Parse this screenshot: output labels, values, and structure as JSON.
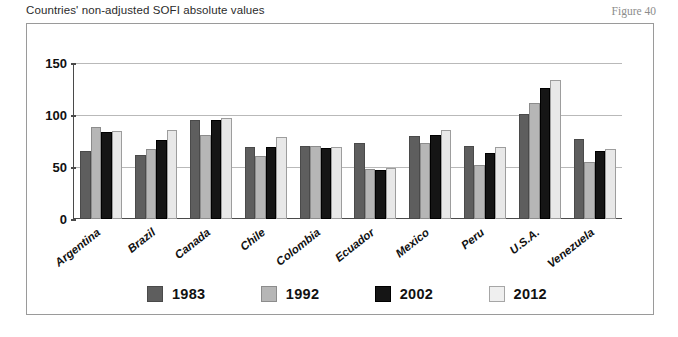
{
  "header": {
    "caption": "Countries' non-adjusted SOFI absolute values",
    "figure_label": "Figure 40"
  },
  "chart_data": {
    "type": "bar",
    "title": "Countries' non-adjusted SOFI absolute values",
    "xlabel": "",
    "ylabel": "",
    "ylim": [
      0,
      150
    ],
    "yticks": [
      0,
      50,
      100,
      150
    ],
    "grid": true,
    "legend_position": "bottom",
    "categories": [
      "Argentina",
      "Brazil",
      "Canada",
      "Chile",
      "Colombia",
      "Ecuador",
      "Mexico",
      "Peru",
      "U.S.A.",
      "Venezuela"
    ],
    "series": [
      {
        "name": "1983",
        "color": "#5e5e5e",
        "values": [
          65,
          62,
          95,
          69,
          70,
          73,
          80,
          70,
          101,
          77
        ]
      },
      {
        "name": "1992",
        "color": "#b6b6b6",
        "values": [
          88,
          67,
          81,
          61,
          70,
          48,
          73,
          52,
          112,
          55
        ]
      },
      {
        "name": "2002",
        "color": "#151515",
        "values": [
          84,
          76,
          95,
          69,
          68,
          47,
          81,
          63,
          126,
          65
        ]
      },
      {
        "name": "2012",
        "color": "#e8e8e8",
        "values": [
          85,
          86,
          97,
          79,
          69,
          49,
          86,
          69,
          134,
          67
        ]
      }
    ]
  }
}
